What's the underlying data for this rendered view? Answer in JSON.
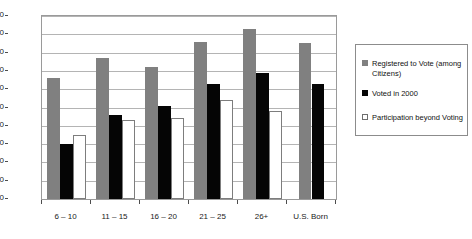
{
  "chart_data": {
    "type": "bar",
    "title": "",
    "subtitle": "",
    "xlabel": "",
    "ylabel": "",
    "ylim": [
      0,
      100
    ],
    "ytick_step": 10,
    "grid": true,
    "legend_position": "right",
    "categories": [
      "6 – 10",
      "11 – 15",
      "16 – 20",
      "21 – 25",
      "26+",
      "U.S. Born"
    ],
    "ytick_labels": [
      "0",
      "10",
      "20",
      "30",
      "40",
      "50",
      "60",
      "70",
      "80",
      "90",
      "100"
    ],
    "series": [
      {
        "name": "Registered to Vote (among Citizens)",
        "color": "#808080",
        "values": [
          66,
          77,
          72,
          86,
          93,
          85
        ]
      },
      {
        "name": "Voted in 2000",
        "color": "#050505",
        "values": [
          30,
          46,
          51,
          63,
          69,
          63
        ]
      },
      {
        "name": "Participation beyond Voting",
        "color": "#ffffff",
        "values": [
          35,
          43,
          44,
          54,
          48,
          null
        ]
      }
    ]
  },
  "legend": {
    "items": [
      {
        "label": "Registered to Vote (among Citizens)",
        "swatch": "gray-swatch"
      },
      {
        "label": "Voted in 2000",
        "swatch": "black-swatch"
      },
      {
        "label": "Participation beyond Voting",
        "swatch": "white-swatch"
      }
    ]
  }
}
